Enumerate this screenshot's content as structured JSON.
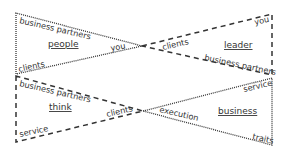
{
  "diagram": {
    "quadrants": [
      {
        "id": "top-left",
        "center_label": "people",
        "edge_style": "dotted",
        "labels": {
          "top_edge": "business partners",
          "apex": "you",
          "bottom_edge": "clients"
        }
      },
      {
        "id": "top-right",
        "center_label": "leader",
        "edge_style": "dashed",
        "labels": {
          "apex": "clients",
          "top_corner": "you",
          "bottom_edge": "business partners"
        }
      },
      {
        "id": "bottom-left",
        "center_label": "think",
        "edge_style": "dashed",
        "labels": {
          "top_edge": "business partners",
          "apex": "clients",
          "bottom_edge": "service"
        }
      },
      {
        "id": "bottom-right",
        "center_label": "business",
        "edge_style": "dotted",
        "labels": {
          "apex": "execution",
          "top_corner": "service",
          "bottom_corner": "traits"
        }
      }
    ],
    "colors": {
      "line": "#333333",
      "text": "#333333",
      "background": "#ffffff"
    }
  }
}
